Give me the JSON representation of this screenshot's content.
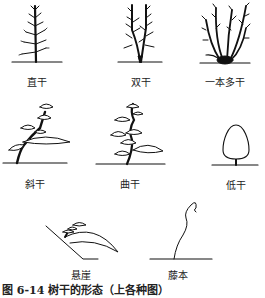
{
  "figure": {
    "forms": [
      {
        "id": "straight-trunk",
        "label": "直干"
      },
      {
        "id": "double-trunk",
        "label": "双干"
      },
      {
        "id": "multi-trunk",
        "label": "一本多干"
      },
      {
        "id": "slanting-trunk",
        "label": "斜干"
      },
      {
        "id": "curved-trunk",
        "label": "曲干"
      },
      {
        "id": "low-trunk",
        "label": "低干"
      },
      {
        "id": "cascade",
        "label": "悬崖"
      },
      {
        "id": "vine",
        "label": "藤本"
      }
    ],
    "caption": "图 6-14  树干的形态（上各种图）"
  }
}
